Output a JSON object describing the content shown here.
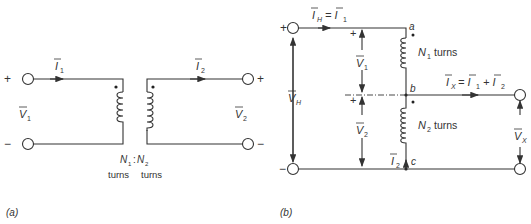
{
  "figure_a": {
    "caption": "(a)",
    "I1": "I",
    "I1_sub": "1",
    "I2": "I",
    "I2_sub": "2",
    "V1": "V",
    "V1_sub": "1",
    "V2": "V",
    "V2_sub": "2",
    "plus_left": "+",
    "minus_left": "−",
    "plus_right": "+",
    "minus_right": "−",
    "ratio_N1": "N",
    "ratio_N1_sub": "1",
    "ratio_colon": ":",
    "ratio_N2": "N",
    "ratio_N2_sub": "2",
    "turns1": "turns",
    "turns2": "turns"
  },
  "figure_b": {
    "caption": "(b)",
    "IH_eq": "I",
    "IH_sub": "H",
    "IH_eq_rhs": "= I",
    "IH_rhs_sub": "1",
    "node_a": "a",
    "node_b": "b",
    "node_c": "c",
    "N1_label": "N",
    "N1_sub": "1",
    "N1_turns": "turns",
    "N2_label": "N",
    "N2_sub": "2",
    "N2_turns": "turns",
    "IX_eq": "I",
    "IX_sub": "X",
    "IX_rhs": "= I",
    "IX_rhs_sub1": "1",
    "IX_plus": "+ I",
    "IX_rhs_sub2": "2",
    "VH": "V",
    "VH_sub": "H",
    "V1": "V",
    "V1_sub": "1",
    "V2": "V",
    "V2_sub": "2",
    "VX": "V",
    "VX_sub": "X",
    "I2": "I",
    "I2_sub": "2",
    "plus_top": "+",
    "minus_bottom": "−",
    "plus_v1": "+",
    "plus_v2": "+"
  }
}
